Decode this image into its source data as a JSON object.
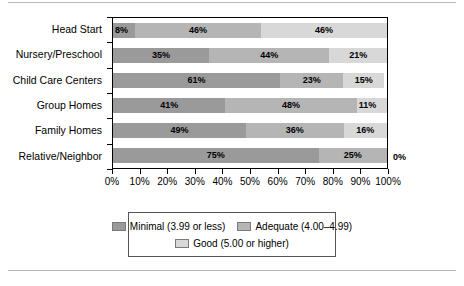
{
  "chart_data": {
    "type": "bar",
    "orientation": "horizontal",
    "stacked": true,
    "normalized": true,
    "title": "",
    "subtitle": "",
    "xlabel": "",
    "ylabel": "",
    "xlim": [
      0,
      100
    ],
    "grid": false,
    "legend_position": "bottom",
    "categories": [
      "Head Start",
      "Nursery/Preschool",
      "Child Care Centers",
      "Group Homes",
      "Family Homes",
      "Relative/Neighbor"
    ],
    "series": [
      {
        "name": "Minimal (3.99 or less)",
        "color": "#9a9a9a",
        "values": [
          8,
          35,
          61,
          41,
          49,
          75
        ],
        "labels": [
          "8%",
          "35%",
          "61%",
          "41%",
          "49%",
          "75%"
        ]
      },
      {
        "name": "Adequate (4.00–4.99)",
        "color": "#b5b5b5",
        "values": [
          46,
          44,
          23,
          48,
          36,
          25
        ],
        "labels": [
          "46%",
          "44%",
          "23%",
          "48%",
          "36%",
          "25%"
        ]
      },
      {
        "name": "Good (5.00 or higher)",
        "color": "#d8d8d8",
        "values": [
          46,
          21,
          15,
          11,
          16,
          0
        ],
        "labels": [
          "46%",
          "21%",
          "15%",
          "11%",
          "16%",
          "0%"
        ]
      }
    ],
    "xticks": [
      0,
      10,
      20,
      30,
      40,
      50,
      60,
      70,
      80,
      90,
      100
    ],
    "xticklabels": [
      "0%",
      "10%",
      "20%",
      "30%",
      "40%",
      "50%",
      "60%",
      "70%",
      "80%",
      "90%",
      "100%"
    ],
    "annotations": [
      {
        "text": "0%",
        "category": "Relative/Neighbor",
        "position": "outside-right"
      }
    ]
  },
  "legend": {
    "rows": [
      [
        {
          "label": "Minimal (3.99 or less)",
          "swatch": "s0"
        },
        {
          "label": "Adequate (4.00–4.99)",
          "swatch": "s1"
        }
      ],
      [
        {
          "label": "Good (5.00 or higher)",
          "swatch": "s2"
        }
      ]
    ]
  },
  "colors": {
    "minimal": "#9a9a9a",
    "adequate": "#b5b5b5",
    "good": "#d8d8d8",
    "axis": "#000000",
    "rule": "#b8b8b8"
  }
}
